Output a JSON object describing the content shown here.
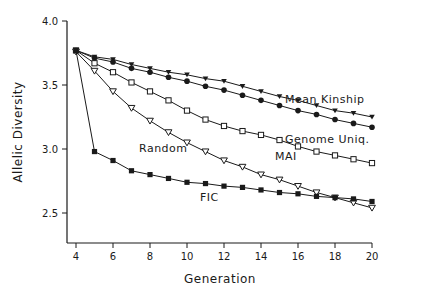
{
  "chart_data": {
    "type": "line",
    "title": "",
    "xlabel": "Generation",
    "ylabel": "Allelic Diversity",
    "xlim": [
      4,
      20
    ],
    "ylim": [
      2.3,
      4.0
    ],
    "xticks": [
      4,
      6,
      8,
      10,
      12,
      14,
      16,
      18,
      20
    ],
    "yticks": [
      2.5,
      3.0,
      3.5,
      4.0
    ],
    "ytick_labels": [
      "2.5",
      "3.0",
      "3.5",
      "4.0"
    ],
    "grid": false,
    "legend": "inline labels",
    "x": [
      4,
      5,
      6,
      7,
      8,
      9,
      10,
      11,
      12,
      13,
      14,
      15,
      16,
      17,
      18,
      19,
      20
    ],
    "series": [
      {
        "name": "Mean Kinship",
        "marker": "filled-triangle-down",
        "values": [
          3.77,
          3.72,
          3.7,
          3.66,
          3.63,
          3.6,
          3.58,
          3.55,
          3.53,
          3.49,
          3.45,
          3.41,
          3.38,
          3.34,
          3.3,
          3.28,
          3.25
        ],
        "label_pos": [
          285,
          103
        ]
      },
      {
        "name": "Genome Uniq.",
        "marker": "filled-circle",
        "values": [
          3.77,
          3.71,
          3.68,
          3.63,
          3.6,
          3.56,
          3.53,
          3.49,
          3.46,
          3.42,
          3.38,
          3.34,
          3.3,
          3.27,
          3.23,
          3.2,
          3.17
        ],
        "label_pos": [
          285,
          143
        ]
      },
      {
        "name": "MAI",
        "marker": "open-square",
        "values": [
          3.77,
          3.67,
          3.6,
          3.52,
          3.45,
          3.38,
          3.3,
          3.23,
          3.18,
          3.14,
          3.11,
          3.07,
          3.02,
          2.98,
          2.95,
          2.92,
          2.89
        ],
        "label_pos": [
          275,
          160
        ]
      },
      {
        "name": "Random",
        "marker": "open-triangle-down",
        "values": [
          3.76,
          3.61,
          3.45,
          3.32,
          3.22,
          3.13,
          3.05,
          2.98,
          2.91,
          2.86,
          2.8,
          2.76,
          2.71,
          2.66,
          2.62,
          2.58,
          2.54
        ],
        "label_pos": [
          139,
          152
        ]
      },
      {
        "name": "FIC",
        "marker": "filled-square",
        "values": [
          3.77,
          2.98,
          2.91,
          2.83,
          2.8,
          2.77,
          2.74,
          2.73,
          2.71,
          2.7,
          2.68,
          2.66,
          2.65,
          2.63,
          2.62,
          2.61,
          2.59
        ],
        "label_pos": [
          200,
          201
        ]
      }
    ]
  },
  "colors": {
    "line": "#1a1a1a",
    "background": "#ffffff"
  }
}
